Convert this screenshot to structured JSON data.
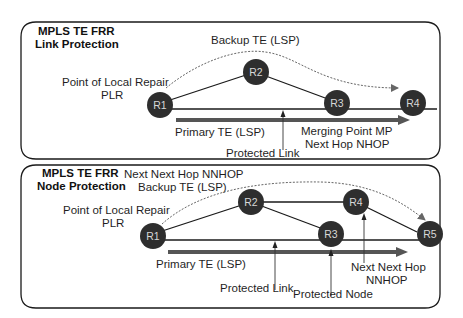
{
  "colors": {
    "node_fill": "#2e2e2e",
    "node_text": "#d8d8d8",
    "link": "#1a1a1a",
    "primary_lsp": "#555555",
    "backup_lsp": "#666666",
    "panel_border": "#1a1a1a"
  },
  "panels": [
    {
      "title_line1": "MPLS TE FRR",
      "title_line2": "Link Protection",
      "labels": {
        "backup": "Backup TE (LSP)",
        "plr_line1": "Point of Local Repair",
        "plr_line2": "PLR",
        "primary": "Primary TE (LSP)",
        "protected_link": "Protected Link",
        "mp_line1": "Merging Point MP",
        "mp_line2": "Next Hop NHOP"
      },
      "nodes": [
        "R1",
        "R2",
        "R3",
        "R4"
      ]
    },
    {
      "title_line1": "MPLS TE FRR",
      "title_line2": "Node Protection",
      "labels": {
        "nnhop_top": "Next Next Hop NNHOP",
        "backup": "Backup TE (LSP)",
        "plr_line1": "Point of Local Repair",
        "plr_line2": "PLR",
        "primary": "Primary TE (LSP)",
        "protected_link": "Protected Link",
        "protected_node": "Protected Node",
        "nnhop_line1": "Next Next Hop",
        "nnhop_line2": "NNHOP"
      },
      "nodes": [
        "R1",
        "R2",
        "R3",
        "R4",
        "R5"
      ]
    }
  ]
}
